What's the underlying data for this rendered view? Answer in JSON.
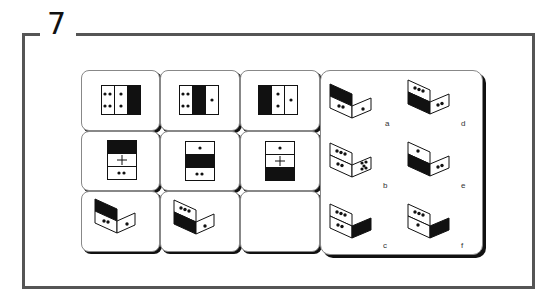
{
  "question": {
    "number": "7"
  },
  "matrix": {
    "rows": [
      [
        {
          "type": "strip-horizontal",
          "cells": [
            "4 dots",
            "2 dots",
            "black"
          ]
        },
        {
          "type": "strip-horizontal",
          "cells": [
            "4 dots",
            "black",
            "1 dot"
          ]
        },
        {
          "type": "strip-horizontal",
          "cells": [
            "black",
            "2 dots",
            "1 dot"
          ]
        }
      ],
      [
        {
          "type": "strip-vertical",
          "cells": [
            "black",
            "plus",
            "2 dots"
          ]
        },
        {
          "type": "strip-vertical",
          "cells": [
            "1 dot",
            "black",
            "2 dots"
          ]
        },
        {
          "type": "strip-vertical",
          "cells": [
            "1 dot",
            "plus",
            "black"
          ]
        }
      ],
      [
        {
          "type": "folded",
          "left_top": "black",
          "left_bottom": "2 dots",
          "right": "1 dot"
        },
        {
          "type": "folded",
          "left_top": "3 dots",
          "left_bottom": "black",
          "right": "1 dot"
        },
        {
          "type": "empty",
          "label": "missing"
        }
      ]
    ]
  },
  "options": [
    {
      "label": "a",
      "left_top": "black",
      "left_bottom": "2 dots",
      "right": "1 dot"
    },
    {
      "label": "b",
      "left_top": "3 dots",
      "left_bottom": "2 dots",
      "right": "5 dots"
    },
    {
      "label": "c",
      "left_top": "3 dots",
      "left_bottom": "2 dots",
      "right": "black"
    },
    {
      "label": "d",
      "left_top": "3 dots",
      "left_bottom": "black",
      "right": "2 dots"
    },
    {
      "label": "e",
      "left_top": "1 dot",
      "left_bottom": "black",
      "right": "2 dots"
    },
    {
      "label": "f",
      "left_top": "3 dots",
      "left_bottom": "1 dot",
      "right": "black"
    }
  ],
  "colors": {
    "frame": "#555555",
    "ink": "#111111",
    "card_border": "#888888"
  }
}
